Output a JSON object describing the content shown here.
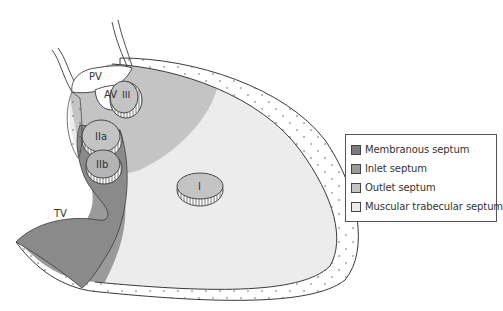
{
  "diagram": {
    "labels": {
      "pv": "PV",
      "av": "AV",
      "iii": "III",
      "iia": "IIa",
      "iib": "IIb",
      "i": "I",
      "tv": "TV"
    }
  },
  "legend": {
    "items": [
      {
        "label": "Membranous septum",
        "color": "#7a7a7a"
      },
      {
        "label": "Inlet septum",
        "color": "#9a9a9a"
      },
      {
        "label": "Outlet septum",
        "color": "#c4c4c4"
      },
      {
        "label": "Muscular trabecular septum",
        "color": "#ececec"
      }
    ]
  },
  "colors": {
    "outline": "#3a3a3a",
    "membranous": "#7a7a7a",
    "inlet": "#9a9a9a",
    "outlet": "#c4c4c4",
    "trabecular": "#ececec",
    "background": "#ffffff"
  }
}
